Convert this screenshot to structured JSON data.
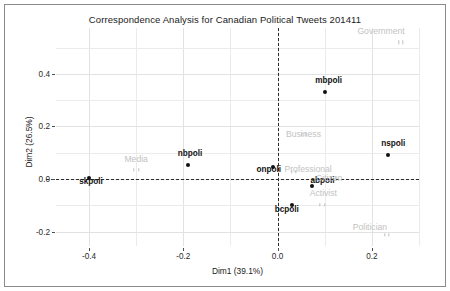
{
  "chart_data": {
    "type": "scatter",
    "title": "Correspondence Analysis for Canadian Political Tweets 201411",
    "xlabel": "Dim1 (39.1%)",
    "ylabel": "Dim2 (26.5%)",
    "xlim": [
      -0.47,
      0.3
    ],
    "ylim": [
      -0.255,
      0.575
    ],
    "xticks": [
      "-0.4",
      "-0.2",
      "0.0",
      "0.2"
    ],
    "xtick_values": [
      -0.4,
      -0.2,
      0.0,
      0.2
    ],
    "yticks": [
      "0.4",
      "0.2",
      "0.0",
      "-0.2"
    ],
    "ytick_values": [
      0.4,
      0.2,
      0.0,
      -0.2
    ],
    "grid": true,
    "legend": "none",
    "reference_lines": {
      "vertical_x": 0.0,
      "horizontal_y": 0.0,
      "style": "dashed"
    },
    "series": [
      {
        "name": "Hashtags",
        "point_color": "#111111",
        "label_color": "#111111",
        "points": [
          {
            "label": "skpoli",
            "x": -0.4,
            "y": 0.005
          },
          {
            "label": "nbpoli",
            "x": -0.19,
            "y": 0.055
          },
          {
            "label": "onpoli",
            "x": -0.01,
            "y": 0.045
          },
          {
            "label": "mbpoli",
            "x": 0.1,
            "y": 0.33
          },
          {
            "label": "nspoli",
            "x": 0.235,
            "y": 0.09
          },
          {
            "label": "abpoli",
            "x": 0.072,
            "y": -0.025
          },
          {
            "label": "bcpoli",
            "x": 0.03,
            "y": -0.1
          }
        ]
      },
      {
        "name": "User types",
        "point_color": "#bdbdbd",
        "label_color": "#c2c2c2",
        "points": [
          {
            "label": "Government",
            "x": 0.262,
            "y": 0.52
          },
          {
            "label": "Business",
            "x": 0.055,
            "y": 0.17
          },
          {
            "label": "Media",
            "x": -0.3,
            "y": 0.035
          },
          {
            "label": "Professional",
            "x": 0.035,
            "y": 0.028
          },
          {
            "label": "Citizen",
            "x": 0.118,
            "y": 0.005
          },
          {
            "label": "Activist",
            "x": 0.095,
            "y": -0.098
          },
          {
            "label": "Politician",
            "x": 0.232,
            "y": -0.212
          }
        ]
      }
    ]
  }
}
